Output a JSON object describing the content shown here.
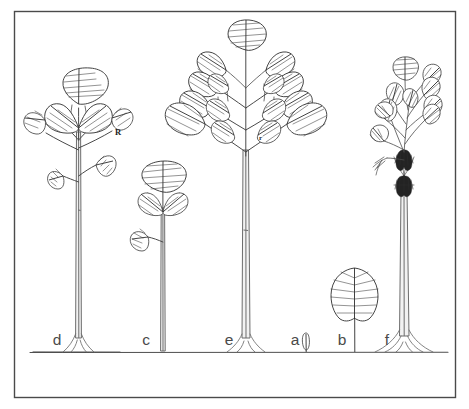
{
  "figure": {
    "background_color": "#ffffff",
    "frame_color": "#4a4a4a",
    "ink_color": "#3a3a3a",
    "ground_line_y": 352
  },
  "stage_labels": [
    {
      "id": "d",
      "text": "d",
      "x": 57,
      "y": 345,
      "description": "tall sapling with single-tier crown and paired lower leaves, buttressed base"
    },
    {
      "id": "c",
      "text": "c",
      "x": 146,
      "y": 345,
      "description": "slender pole with small terminal leaf cluster"
    },
    {
      "id": "e",
      "text": "e",
      "x": 229,
      "y": 345,
      "description": "tallest tree with large multi-tier branched crown"
    },
    {
      "id": "a",
      "text": "a",
      "x": 295,
      "y": 345,
      "description": "germinating seedling, cotyledon only"
    },
    {
      "id": "b",
      "text": "b",
      "x": 342,
      "y": 345,
      "description": "young seedling bearing one large simple leaf"
    },
    {
      "id": "f",
      "text": "f",
      "x": 387,
      "y": 345,
      "description": "mature tree with reduced crown, fibrous apex and strong buttress roots"
    }
  ],
  "order_labels": [
    {
      "id": "R",
      "text": "R",
      "x": 115,
      "y": 135,
      "size": "major",
      "description": "major branch order on stage d"
    },
    {
      "id": "r",
      "text": "r",
      "x": 259,
      "y": 140,
      "size": "minor",
      "description": "minor branch order on stage e"
    }
  ],
  "icons": {
    "leaf": "leaf-icon",
    "trunk": "trunk-icon",
    "root": "buttress-root-icon",
    "seedling": "seedling-icon"
  }
}
